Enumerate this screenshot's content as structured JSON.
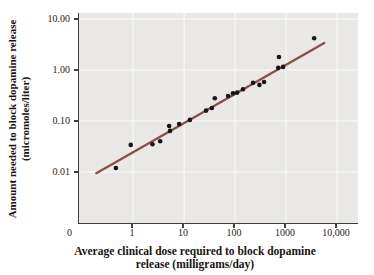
{
  "chart_data": {
    "type": "scatter",
    "title": "",
    "xlabel": "Average clinical dose required to block dopamine release (milligrams/day)",
    "xlabel_lines": [
      "Average clinical dose required to block dopamine",
      "release (milligrams/day)"
    ],
    "ylabel": "Amount needed to block dopamine release (micromoles/liter)",
    "ylabel_lines": [
      "Amount needed to block dopamine release",
      "(micromoles/liter)"
    ],
    "x_scale": "log",
    "y_scale": "log",
    "xlim": [
      0.087,
      25700
    ],
    "ylim": [
      0.001,
      13.1
    ],
    "grid": true,
    "origin_label": "0",
    "x_ticks": [
      {
        "value": 1,
        "label": "1"
      },
      {
        "value": 10,
        "label": "10"
      },
      {
        "value": 100,
        "label": "100"
      },
      {
        "value": 1000,
        "label": "1000"
      },
      {
        "value": 10000,
        "label": "10,000"
      }
    ],
    "y_ticks": [
      {
        "value": 10,
        "label": "10.00"
      },
      {
        "value": 1,
        "label": "1.00"
      },
      {
        "value": 0.1,
        "label": "0.10"
      },
      {
        "value": 0.01,
        "label": "0.01"
      }
    ],
    "points": [
      [
        0.46,
        0.012
      ],
      [
        0.9,
        0.034
      ],
      [
        2.4,
        0.035
      ],
      [
        3.4,
        0.04
      ],
      [
        5.1,
        0.08
      ],
      [
        5.3,
        0.064
      ],
      [
        8.0,
        0.087
      ],
      [
        13,
        0.105
      ],
      [
        27,
        0.16
      ],
      [
        35,
        0.18
      ],
      [
        40,
        0.28
      ],
      [
        73,
        0.31
      ],
      [
        91,
        0.35
      ],
      [
        110,
        0.36
      ],
      [
        143,
        0.42
      ],
      [
        225,
        0.56
      ],
      [
        300,
        0.51
      ],
      [
        370,
        0.58
      ],
      [
        700,
        1.1
      ],
      [
        875,
        1.15
      ],
      [
        725,
        1.8
      ],
      [
        3550,
        4.2
      ]
    ],
    "fit_line": {
      "x1": 0.19,
      "y1": 0.0095,
      "x2": 5600,
      "y2": 3.4
    },
    "colors": {
      "panel_background": "#e9e8e6",
      "gridline": "#fbfbfa",
      "axis": "#3f3f3d",
      "point": "#161616",
      "fit_line": "#8a5048"
    }
  }
}
